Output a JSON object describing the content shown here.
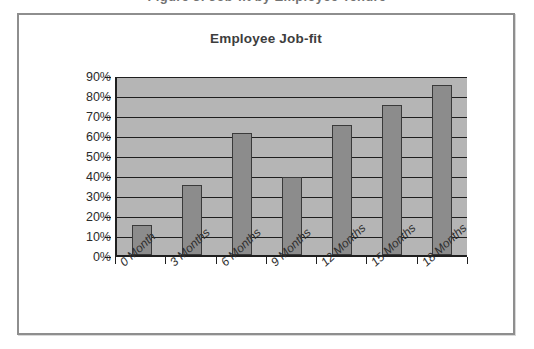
{
  "document": {
    "clipped_header_text": "Figure 3: Job-fit by Employee Tenure",
    "frame_color": "#8e8e8e"
  },
  "chart_data": {
    "type": "bar",
    "title": "Employee Job-fit",
    "xlabel": "",
    "ylabel": "",
    "categories": [
      "0 Month",
      "3 Months",
      "6 Months",
      "9 Months",
      "12 Months",
      "15 Months",
      "18 Months"
    ],
    "values": [
      15,
      35,
      61,
      39,
      65,
      75,
      85
    ],
    "value_labels": [
      "15%",
      "35%",
      "61%",
      "39%",
      "65%",
      "75%",
      "85%"
    ],
    "ytick_labels": [
      "90%",
      "80%",
      "70%",
      "60%",
      "50%",
      "40%",
      "30%",
      "20%",
      "10%",
      "0%"
    ],
    "ytick_values": [
      90,
      80,
      70,
      60,
      50,
      40,
      30,
      20,
      10,
      0
    ],
    "ylim": [
      0,
      90
    ],
    "grid": true,
    "legend": "none",
    "colors": {
      "bar_fill": "#8c8c8c",
      "bar_border": "#3a3a3a",
      "plot_background": "#b5b5b5",
      "axis": "#1f1f1f",
      "gridline": "#1f1f1f",
      "title_text": "#3d3d3d",
      "tick_text": "#2b2b2b"
    }
  }
}
